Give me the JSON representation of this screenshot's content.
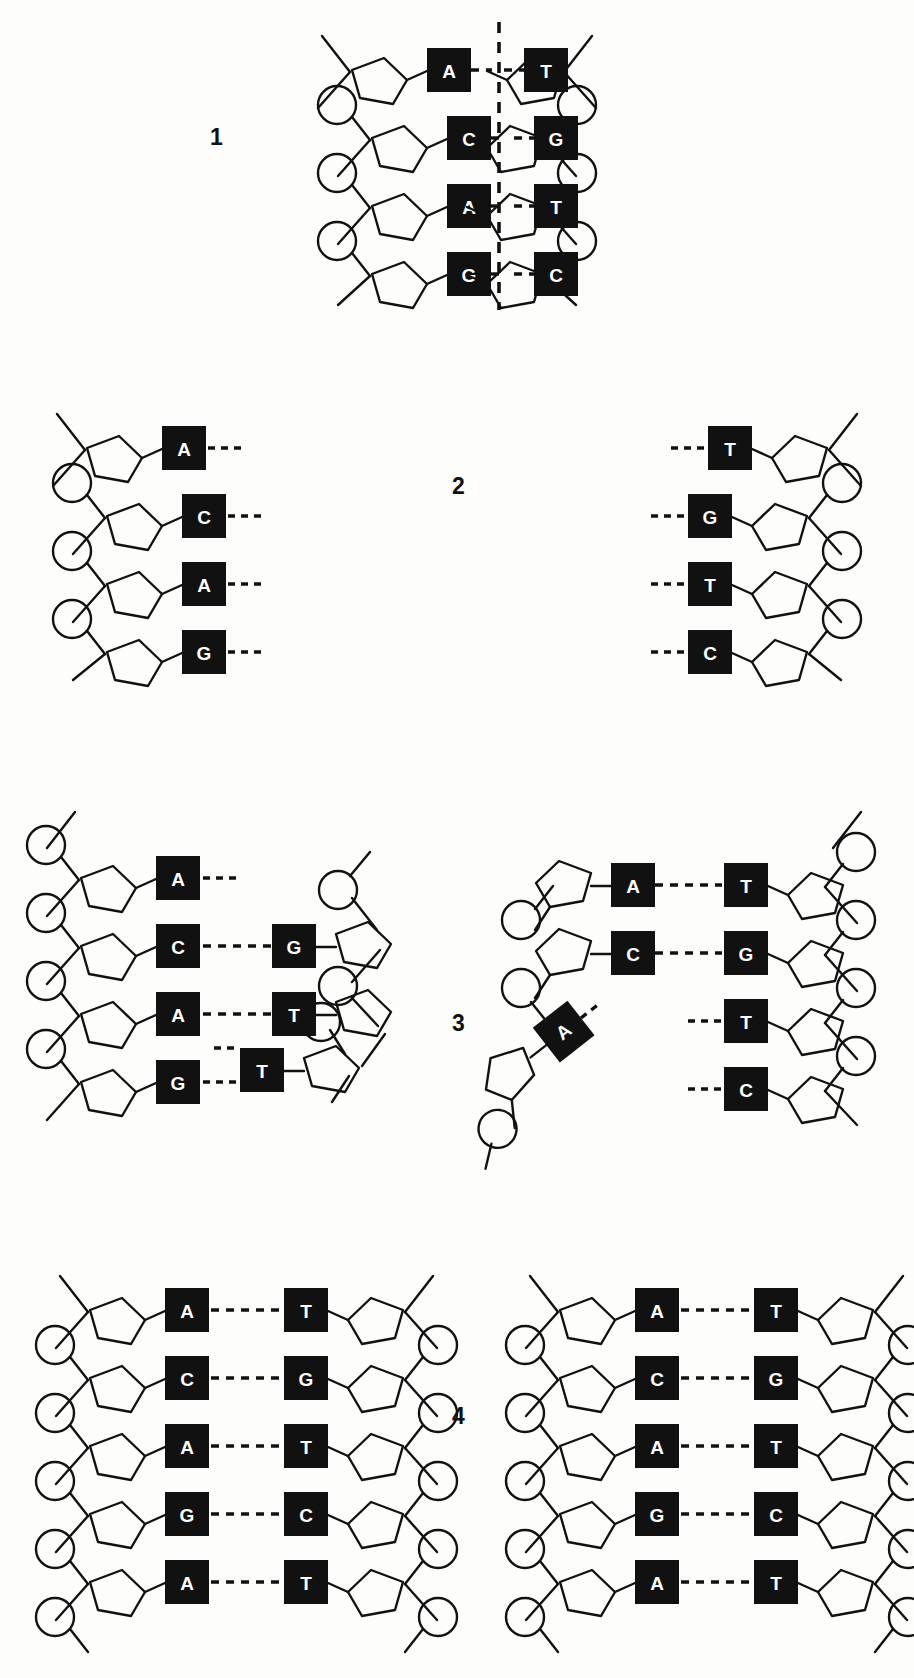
{
  "figure": {
    "ink_color": "#111111",
    "background_color": "#fdfdfc",
    "base_box_fill": "#111111",
    "base_letter_color": "#ffffff"
  },
  "panels": [
    {
      "number": "1",
      "caption_position": "left",
      "description": "Intact DNA double helix with central dashed separation line",
      "left_strand_bases": [
        "A",
        "C",
        "A",
        "G"
      ],
      "right_strand_bases": [
        "T",
        "G",
        "T",
        "C"
      ],
      "pairs": [
        {
          "left": "A",
          "right": "T"
        },
        {
          "left": "C",
          "right": "G"
        },
        {
          "left": "A",
          "right": "T"
        },
        {
          "left": "G",
          "right": "C"
        }
      ],
      "has_split_line": true
    },
    {
      "number": "2",
      "caption_position": "center",
      "description": "Two separated parental strands, hydrogen bonds broken",
      "left_strand_bases": [
        "A",
        "C",
        "A",
        "G"
      ],
      "right_strand_bases": [
        "T",
        "G",
        "T",
        "C"
      ],
      "has_split_line": false
    },
    {
      "number": "3",
      "caption_position": "center",
      "description": "New complementary nucleotides pairing onto each template strand",
      "left_assembly": {
        "template_bases": [
          "A",
          "C",
          "A",
          "G"
        ],
        "new_bases": [
          "",
          "G",
          "T",
          ""
        ],
        "paired_rows": [
          false,
          true,
          true,
          false
        ],
        "free_nucleotide": {
          "base": "T",
          "orientation": "horizontal"
        }
      },
      "right_assembly": {
        "template_bases": [
          "T",
          "G",
          "T",
          "C"
        ],
        "new_bases": [
          "A",
          "C",
          "",
          ""
        ],
        "paired_rows": [
          true,
          true,
          false,
          false
        ],
        "free_nucleotide": {
          "base": "A",
          "orientation": "tilted"
        }
      }
    },
    {
      "number": "4",
      "caption_position": "center",
      "description": "Two identical daughter DNA molecules",
      "left_helix": {
        "left_strand_bases": [
          "A",
          "C",
          "A",
          "G"
        ],
        "right_strand_bases": [
          "T",
          "G",
          "T",
          "C"
        ]
      },
      "right_helix": {
        "left_strand_bases": [
          "A",
          "C",
          "A",
          "G"
        ],
        "right_strand_bases": [
          "T",
          "G",
          "T",
          "C"
        ]
      }
    }
  ],
  "legend_symbols": {
    "circle": "phosphate-group",
    "pentagon": "deoxyribose-sugar",
    "black_square": "nitrogenous-base",
    "dashed_line": "hydrogen-bond"
  }
}
